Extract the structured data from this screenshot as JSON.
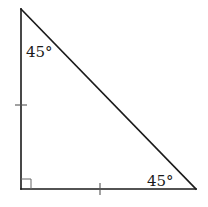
{
  "diagram": {
    "type": "right-isosceles-triangle",
    "colors": {
      "stroke": "#1a1a1a",
      "tick": "#555555",
      "background": "#ffffff"
    },
    "vertices": {
      "top": [
        21,
        9
      ],
      "right_angle": [
        21,
        189
      ],
      "bottom_right": [
        196,
        189
      ]
    },
    "labels": {
      "top_angle": "45°",
      "bottom_right_angle": "45°"
    },
    "marks": {
      "right_angle_marker": "square",
      "congruent_ticks": [
        "left-leg",
        "bottom-leg"
      ]
    }
  }
}
